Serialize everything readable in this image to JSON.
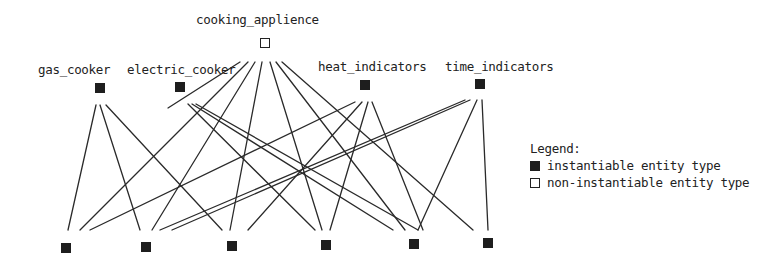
{
  "diagram": {
    "nodes": {
      "cooking_applience": {
        "label": "cooking_applience",
        "type": "non-instantiable",
        "x": 265,
        "y": 43,
        "label_x": 196,
        "label_y": 14
      },
      "gas_cooker": {
        "label": "gas_cooker",
        "type": "instantiable",
        "x": 100,
        "y": 88,
        "label_x": 38,
        "label_y": 64
      },
      "electric_cooker": {
        "label": "electric_cooker",
        "type": "instantiable",
        "x": 180,
        "y": 87,
        "label_x": 127,
        "label_y": 64
      },
      "heat_indicators": {
        "label": "heat_indicators",
        "type": "instantiable",
        "x": 365,
        "y": 85,
        "label_x": 318,
        "label_y": 61
      },
      "time_indicators": {
        "label": "time_indicators",
        "type": "instantiable",
        "x": 480,
        "y": 84,
        "label_x": 445,
        "label_y": 61
      },
      "b1": {
        "label": "",
        "type": "instantiable",
        "x": 66,
        "y": 248
      },
      "b2": {
        "label": "",
        "type": "instantiable",
        "x": 146,
        "y": 247
      },
      "b3": {
        "label": "",
        "type": "instantiable",
        "x": 232,
        "y": 246
      },
      "b4": {
        "label": "",
        "type": "instantiable",
        "x": 326,
        "y": 245
      },
      "b5": {
        "label": "",
        "type": "instantiable",
        "x": 414,
        "y": 244
      },
      "b6": {
        "label": "",
        "type": "instantiable",
        "x": 488,
        "y": 243
      }
    },
    "edges": [
      {
        "from": [
          240,
          62
        ],
        "to": [
          168,
          108
        ]
      },
      {
        "from": [
          248,
          62
        ],
        "to": [
          80,
          230
        ]
      },
      {
        "from": [
          255,
          62
        ],
        "to": [
          152,
          230
        ]
      },
      {
        "from": [
          262,
          62
        ],
        "to": [
          230,
          230
        ]
      },
      {
        "from": [
          270,
          62
        ],
        "to": [
          322,
          230
        ]
      },
      {
        "from": [
          276,
          62
        ],
        "to": [
          405,
          230
        ]
      },
      {
        "from": [
          282,
          62
        ],
        "to": [
          473,
          230
        ]
      },
      {
        "from": [
          96,
          105
        ],
        "to": [
          68,
          230
        ]
      },
      {
        "from": [
          100,
          105
        ],
        "to": [
          140,
          230
        ]
      },
      {
        "from": [
          106,
          105
        ],
        "to": [
          222,
          230
        ]
      },
      {
        "from": [
          188,
          104
        ],
        "to": [
          315,
          230
        ]
      },
      {
        "from": [
          192,
          104
        ],
        "to": [
          393,
          230
        ]
      },
      {
        "from": [
          196,
          104
        ],
        "to": [
          418,
          230
        ]
      },
      {
        "from": [
          355,
          102
        ],
        "to": [
          90,
          230
        ]
      },
      {
        "from": [
          362,
          102
        ],
        "to": [
          248,
          230
        ]
      },
      {
        "from": [
          368,
          102
        ],
        "to": [
          330,
          230
        ]
      },
      {
        "from": [
          372,
          102
        ],
        "to": [
          423,
          230
        ]
      },
      {
        "from": [
          465,
          100
        ],
        "to": [
          160,
          230
        ]
      },
      {
        "from": [
          470,
          100
        ],
        "to": [
          172,
          230
        ]
      },
      {
        "from": [
          477,
          100
        ],
        "to": [
          418,
          230
        ]
      },
      {
        "from": [
          482,
          100
        ],
        "to": [
          488,
          230
        ]
      }
    ]
  },
  "legend": {
    "title": "Legend:",
    "items": [
      {
        "label": "instantiable entity type",
        "swatch": "inst"
      },
      {
        "label": "non-instantiable entity type",
        "swatch": "noninst"
      }
    ]
  }
}
